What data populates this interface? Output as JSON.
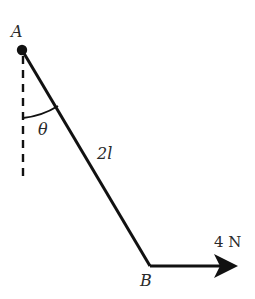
{
  "figure": {
    "type": "physics-free-body-diagram"
  },
  "labels": {
    "point_a": "A",
    "point_b": "B",
    "angle": "θ",
    "rod_length": "2l",
    "force": "4 N"
  },
  "geometry": {
    "pivot_a": {
      "x": 22,
      "y": 50
    },
    "end_b": {
      "x": 150,
      "y": 266
    },
    "arrow_tip": {
      "x": 238,
      "y": 266
    },
    "vertical_dashed_end_y": 176
  },
  "colors": {
    "line": "#111111",
    "text": "#2a2a2a",
    "background": "#ffffff"
  }
}
